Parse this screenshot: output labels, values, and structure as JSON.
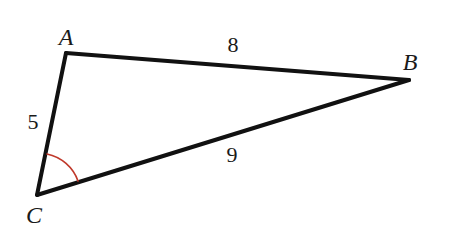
{
  "figure": {
    "background_color": "#ffffff",
    "width": 451,
    "height": 248
  },
  "style": {
    "edge_color": "#111111",
    "edge_width": 4,
    "arc_color": "#C0392B",
    "arc_width": 1.6,
    "label_color": "#1a1a1a"
  },
  "chart_data": {
    "type": "diagram",
    "shape": "triangle",
    "vertices": [
      {
        "name": "A",
        "x": 66,
        "y": 53,
        "label_x": 66,
        "label_y": 37
      },
      {
        "name": "B",
        "x": 409,
        "y": 80,
        "label_x": 410,
        "label_y": 62
      },
      {
        "name": "C",
        "x": 37,
        "y": 195,
        "label_x": 34,
        "label_y": 215
      }
    ],
    "edges": [
      {
        "from": "A",
        "to": "B",
        "length": "8",
        "label_x": 233,
        "label_y": 45
      },
      {
        "from": "C",
        "to": "B",
        "length": "9",
        "label_x": 232,
        "label_y": 155
      },
      {
        "from": "C",
        "to": "A",
        "length": "5",
        "label_x": 33,
        "label_y": 122
      }
    ],
    "angle_marks": [
      {
        "at_vertex": "C",
        "color": "#C0392B",
        "radius": 42,
        "start_x": 47,
        "start_y": 154,
        "end_x": 78,
        "end_y": 181
      }
    ]
  },
  "vertices": {
    "a_label": "A",
    "b_label": "B",
    "c_label": "C"
  },
  "sides": {
    "ab_length": "8",
    "cb_length": "9",
    "ca_length": "5"
  }
}
